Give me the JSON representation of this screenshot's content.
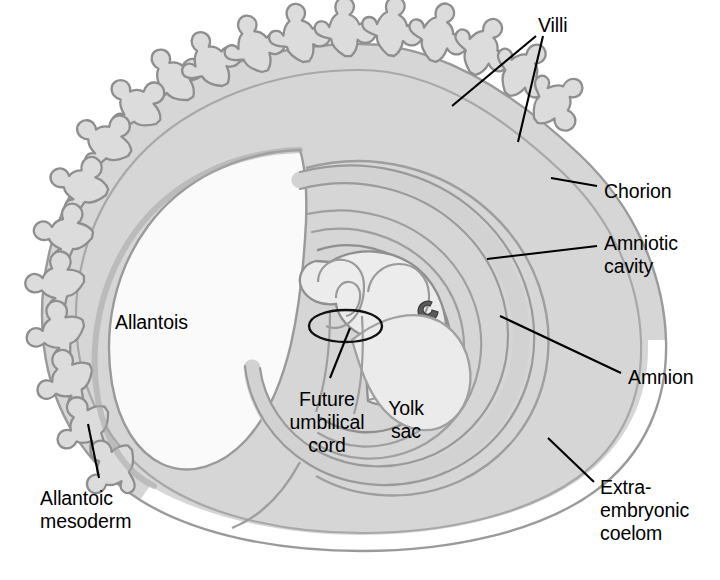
{
  "figure": {
    "type": "anatomical-diagram",
    "background_color": "#ffffff",
    "palette": {
      "villi_fill": "#dcdcdc",
      "chorion_fill": "#d8d8d8",
      "membrane_stroke": "#8a8a8a",
      "embryo_fill": "#ececec",
      "yolk_sac_fill": "#ebebeb",
      "allantois_fill": "#fafafa",
      "leader_line": "#000000",
      "text": "#000000",
      "eye_spot": "#5a5a5a"
    }
  },
  "labels": {
    "villi": {
      "text": "Villi",
      "x": 538,
      "y": 14,
      "align": "left"
    },
    "chorion": {
      "text": "Chorion",
      "x": 604,
      "y": 180,
      "align": "left"
    },
    "amniotic_cavity": {
      "text": "Amniotic\ncavity",
      "x": 604,
      "y": 232,
      "align": "left"
    },
    "amnion": {
      "text": "Amnion",
      "x": 628,
      "y": 366,
      "align": "left"
    },
    "extra_embryonic_coelom": {
      "text": "Extra-\nembryonic\ncoelom",
      "x": 600,
      "y": 476,
      "align": "left"
    },
    "allantois": {
      "text": "Allantois",
      "x": 115,
      "y": 311,
      "align": "left"
    },
    "allantoic_mesoderm": {
      "text": "Allantoic\nmesoderm",
      "x": 40,
      "y": 487,
      "align": "left"
    },
    "future_umbilical_cord": {
      "text": "Future\numbilical\ncord",
      "x": 327,
      "y": 388,
      "align": "center"
    },
    "yolk_sac": {
      "text": "Yolk\nsac",
      "x": 406,
      "y": 397,
      "align": "center"
    }
  },
  "structures": [
    {
      "name": "chorion",
      "description": "Outer membrane enclosing the whole conceptus, thick and villous on the upper-left, thin on the lower-right"
    },
    {
      "name": "villi",
      "description": "Branching finger-like projections of the chorion along the upper and left margin"
    },
    {
      "name": "allantois",
      "description": "Large pale sac filling the left interior"
    },
    {
      "name": "allantoic-mesoderm",
      "description": "Mesodermal layer covering the allantois at the lower left"
    },
    {
      "name": "amnion",
      "description": "Inner membrane surrounding the embryo"
    },
    {
      "name": "amniotic-cavity",
      "description": "Space between the amnion and the embryo"
    },
    {
      "name": "embryo",
      "description": "Curled embryo in the centre with a dark eye spot"
    },
    {
      "name": "yolk-sac",
      "description": "Pear-shaped sac hanging below and right of the umbilical stalk"
    },
    {
      "name": "future-umbilical-cord",
      "description": "Stalk at the centre encircled by a black ring"
    },
    {
      "name": "extra-embryonic-coelom",
      "description": "Large cavity between the chorion and the amnion/yolk sac"
    }
  ],
  "leader_lines": [
    {
      "name": "villi-leader-a",
      "from": [
        536,
        36
      ],
      "to": [
        452,
        106
      ]
    },
    {
      "name": "villi-leader-b",
      "from": [
        543,
        36
      ],
      "to": [
        518,
        140
      ]
    },
    {
      "name": "chorion-leader",
      "from": [
        597,
        186
      ],
      "to": [
        553,
        178
      ]
    },
    {
      "name": "amniotic-cavity-leader",
      "from": [
        597,
        246
      ],
      "to": [
        487,
        259
      ]
    },
    {
      "name": "amnion-leader",
      "from": [
        621,
        373
      ],
      "to": [
        500,
        316
      ]
    },
    {
      "name": "coelom-leader",
      "from": [
        594,
        482
      ],
      "to": [
        548,
        438
      ]
    },
    {
      "name": "allantoic-mesoderm-leader",
      "from": [
        99,
        478
      ],
      "to": [
        88,
        424
      ]
    },
    {
      "name": "umbilical-cord-leader",
      "from": [
        330,
        378
      ],
      "to": [
        348,
        327
      ]
    }
  ]
}
